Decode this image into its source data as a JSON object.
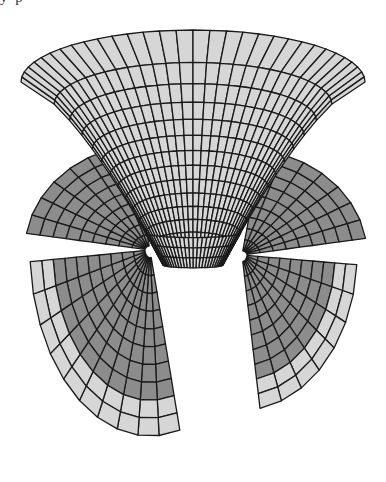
{
  "page": {
    "clipped_text_fragment": "y                                                     p"
  },
  "figure": {
    "type": "3d-surface-wireframe",
    "colors": {
      "light_face": "#d6d6d6",
      "dark_face": "#8c8c8c",
      "mesh_line": "#1a1a1a",
      "background": "#ffffff"
    },
    "funnel": {
      "center_x": 193,
      "top_y": 30,
      "top_rx": 172,
      "top_ry": 52,
      "neck_y": 265,
      "neck_rx": 30,
      "neck_ry": 8,
      "rings": 14,
      "spokes": 32
    },
    "left_wing": {
      "cx": 150,
      "cy": 250
    },
    "right_wing": {
      "cx": 242,
      "cy": 255
    }
  }
}
